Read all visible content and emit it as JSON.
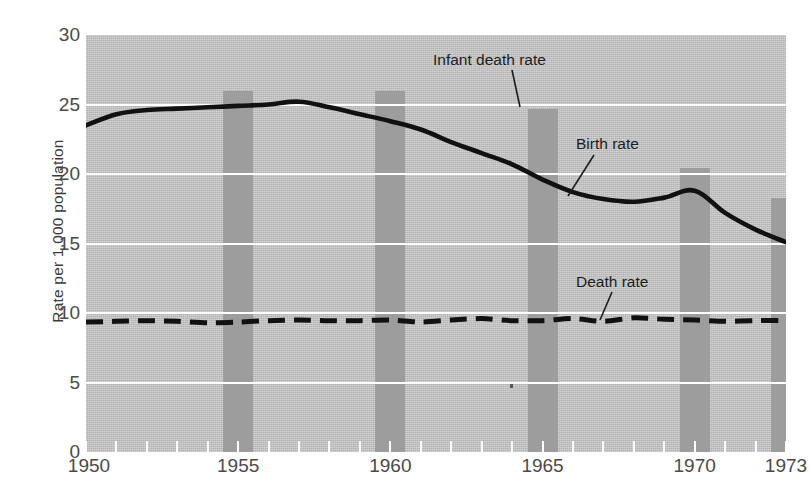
{
  "chart_data": {
    "type": "line",
    "title": "",
    "xlabel": "",
    "ylabel": "Rate per 1,000 population",
    "xlim": [
      1950,
      1973
    ],
    "ylim": [
      0,
      30
    ],
    "grid": true,
    "legend_position": "inline-annotations",
    "y_ticks": [
      0,
      5,
      10,
      15,
      20,
      25,
      30
    ],
    "y_tick_labels": [
      "0",
      "5",
      "10",
      "15",
      "20",
      "25",
      "30"
    ],
    "x_tick_labels": [
      "1950",
      "1955",
      "1960",
      "1965",
      "1970",
      "1973"
    ],
    "x_tick_values": [
      1950,
      1955,
      1960,
      1965,
      1970,
      1973
    ],
    "x": [
      1950,
      1951,
      1952,
      1953,
      1954,
      1955,
      1956,
      1957,
      1958,
      1959,
      1960,
      1961,
      1962,
      1963,
      1964,
      1965,
      1966,
      1967,
      1968,
      1969,
      1970,
      1971,
      1972,
      1973
    ],
    "series": [
      {
        "name": "Birth rate",
        "style": "solid",
        "color": "#111111",
        "values": [
          23.5,
          24.3,
          24.6,
          24.7,
          24.8,
          24.9,
          25.0,
          25.2,
          24.8,
          24.3,
          23.8,
          23.2,
          22.3,
          21.5,
          20.7,
          19.6,
          18.7,
          18.2,
          18.0,
          18.3,
          18.8,
          17.2,
          16.0,
          15.1
        ]
      },
      {
        "name": "Death rate",
        "style": "dashed",
        "color": "#111111",
        "values": [
          9.35,
          9.4,
          9.45,
          9.4,
          9.3,
          9.35,
          9.45,
          9.5,
          9.45,
          9.45,
          9.5,
          9.35,
          9.5,
          9.6,
          9.45,
          9.45,
          9.6,
          9.4,
          9.65,
          9.55,
          9.5,
          9.4,
          9.45,
          9.45
        ]
      }
    ],
    "annotations": [
      {
        "text": "Infant death rate",
        "id": "infant-death-rate"
      },
      {
        "text": "Birth rate",
        "id": "birth-rate"
      },
      {
        "text": "Death rate",
        "id": "death-rate"
      }
    ],
    "highlight_bars": {
      "name": "Infant death rate",
      "note": "Shaded vertical bars encoding the infant death rate at 5-year marks",
      "years": [
        1955,
        1960,
        1965,
        1970,
        1973
      ],
      "values": [
        26.0,
        26.0,
        24.7,
        20.4,
        18.3
      ],
      "color": "#9d9d9d"
    },
    "plot_background": "#c3c3c3",
    "gridline_color": "#ffffff"
  }
}
